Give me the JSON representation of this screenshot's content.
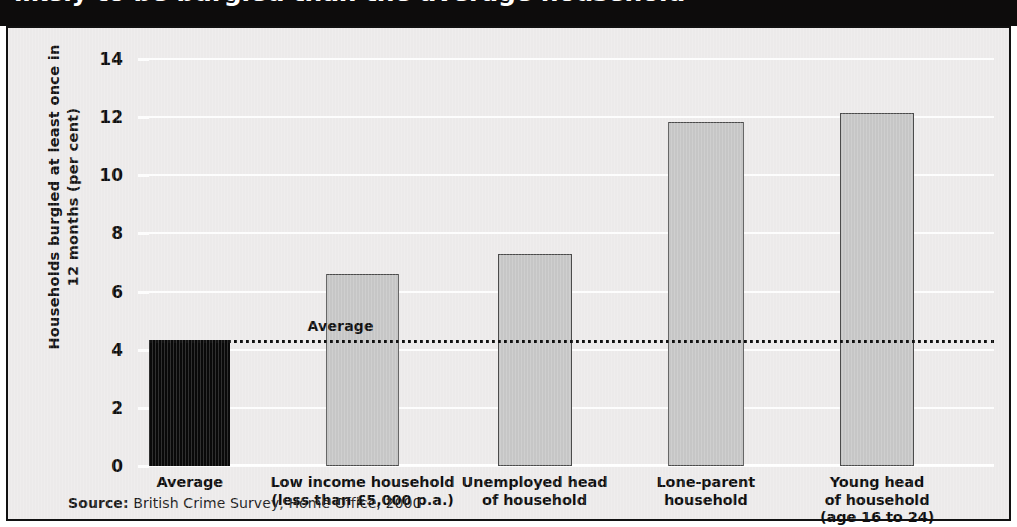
{
  "header": {
    "title": "likely to be burgled than the average household"
  },
  "chart_data": {
    "type": "bar",
    "title": "likely to be burgled than the average household",
    "xlabel": "",
    "ylabel": "Households burgled at least once in 12 months (per cent)",
    "ylim": [
      0,
      14
    ],
    "yticks": [
      "0",
      "2",
      "4",
      "6",
      "8",
      "10",
      "12",
      "14"
    ],
    "ytick_values": [
      0,
      2,
      4,
      6,
      8,
      10,
      12,
      14
    ],
    "grid": true,
    "legend": "none",
    "categories": [
      "Average",
      "Low income household\n(less than £5,000 p.a.)",
      "Unemployed head\nof household",
      "Lone-parent\nhousehold",
      "Young head\nof household\n(age 16 to 24)"
    ],
    "category_lines": [
      [
        "Average"
      ],
      [
        "Low income household",
        "(less than £5,000 p.a.)"
      ],
      [
        "Unemployed head",
        "of household"
      ],
      [
        "Lone-parent",
        "household"
      ],
      [
        "Young head",
        "of household",
        "(age 16 to 24)"
      ]
    ],
    "values": [
      4.35,
      6.6,
      7.3,
      11.85,
      12.15
    ],
    "bar_colors": [
      "#090909",
      "#c6c6c6",
      "#c6c6c6",
      "#c6c6c6",
      "#c6c6c6"
    ],
    "annotations": [
      {
        "type": "reference-line",
        "label": "Average",
        "value": 4.35,
        "style": "dotted"
      }
    ]
  },
  "footer": {
    "source_label": "Source:",
    "source_text": " British Crime Survey, Home Office, 2000"
  },
  "colors": {
    "plot_background": "#eceaea",
    "gridline": "#fdfdfd",
    "bar_dark": "#090909",
    "bar_light": "#c6c6c6",
    "bar_light_border": "#4b4b4b",
    "title_band": "#0d0c0c",
    "frame_border": "#111111"
  }
}
